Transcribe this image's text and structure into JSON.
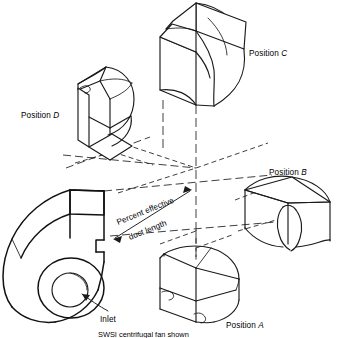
{
  "figure": {
    "kind": "isometric-line-drawing",
    "background_color": "#ffffff",
    "line_color": "#1a1a1a",
    "caption": "SWSI centrifugal fan shown"
  },
  "labels": {
    "position_a": {
      "prefix": "Position ",
      "letter": "A"
    },
    "position_b": {
      "prefix": "Position ",
      "letter": "B"
    },
    "position_c": {
      "prefix": "Position ",
      "letter": "C"
    },
    "position_d": {
      "prefix": "Position ",
      "letter": "D"
    },
    "inlet": "Inlet",
    "dimension_line_1": "Percent effective",
    "dimension_line_2": "duct length"
  },
  "parts": [
    {
      "name": "centrifugal-fan-housing",
      "label": "Inlet"
    },
    {
      "name": "duct-position-a",
      "label": "Position A"
    },
    {
      "name": "duct-position-b",
      "label": "Position B"
    },
    {
      "name": "duct-position-c",
      "label": "Position C"
    },
    {
      "name": "duct-position-d",
      "label": "Position D"
    }
  ],
  "annotations": {
    "dimension": {
      "text": "Percent effective duct length",
      "style": "double-headed-arrow",
      "rotation_deg": -22
    }
  }
}
